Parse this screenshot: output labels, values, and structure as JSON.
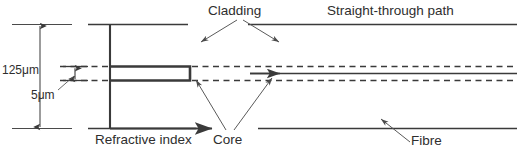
{
  "diagram": {
    "stroke_color": "#3a3a3a",
    "text_color": "#2e2e2e",
    "background_color": "#ffffff",
    "labels": {
      "cladding": "Cladding",
      "straight_through_path": "Straight-through path",
      "refractive_index": "Refractive index",
      "core": "Core",
      "fibre": "Fibre"
    },
    "dimensions": [
      {
        "id": "cladding-diameter",
        "value": "125",
        "unit": "μm",
        "text": "125μm"
      },
      {
        "id": "core-diameter",
        "value": "5",
        "unit": "μm",
        "text": "5μm"
      }
    ]
  }
}
